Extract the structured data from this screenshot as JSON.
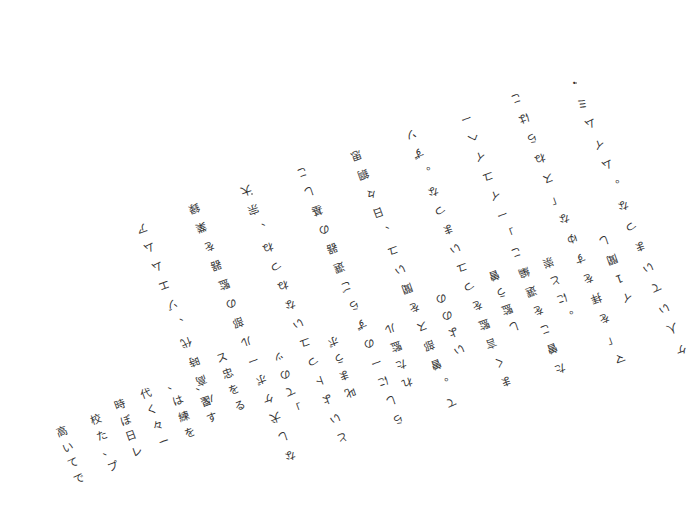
{
  "document": {
    "type": "scanned-vertical-japanese-text",
    "background": "#ffffff",
    "ink": "#333333",
    "rotated_columns": [
      {
        "x": 574,
        "y": 82,
        "dx": 8.2,
        "dy": 20.5,
        "rot": 160,
        "chars": [
          "・",
          "ミ",
          "ム",
          "イ",
          "ム",
          "。",
          "な",
          "つ",
          "ま",
          "い",
          "て",
          "い",
          "人",
          "ケ"
        ]
      },
      {
        "x": 604,
        "y": 240,
        "dx": 7.5,
        "dy": 19,
        "rot": 160,
        "chars": [
          "し",
          "聞",
          "1",
          "イ"
        ]
      },
      {
        "x": 516,
        "y": 98,
        "dx": 8.0,
        "dy": 20,
        "rot": 160,
        "chars": [
          "こ",
          "は",
          "ら",
          "ね",
          "ス",
          "「",
          "な",
          "ゆ",
          "す",
          "を",
          "拝",
          "を",
          "「",
          "マ"
        ]
      },
      {
        "x": 548,
        "y": 262,
        "dx": 7.0,
        "dy": 18,
        "rot": 160,
        "chars": [
          "崇",
          "と",
          "に",
          "。"
        ]
      },
      {
        "x": 466,
        "y": 118,
        "dx": 7.2,
        "dy": 19.2,
        "rot": 160,
        "chars": [
          "ー",
          "ヘ",
          "イ",
          "ユ",
          "イ",
          "ー",
          "」",
          "こ",
          "編",
          "選",
          "を",
          "こ",
          "曽",
          "た"
        ]
      },
      {
        "x": 494,
        "y": 275,
        "dx": 6.5,
        "dy": 17,
        "rot": 160,
        "chars": [
          "曽",
          "う",
          "監",
          "し"
        ]
      },
      {
        "x": 411,
        "y": 134,
        "dx": 7.3,
        "dy": 19,
        "rot": 160,
        "chars": [
          "ソ",
          "ず",
          "。",
          "な",
          "つ",
          "ま",
          "い",
          "ユ",
          "つ",
          "を",
          "監",
          "言",
          "く",
          "ま"
        ]
      },
      {
        "x": 441,
        "y": 298,
        "dx": 6.0,
        "dy": 17,
        "rot": 160,
        "chars": [
          "の",
          "の",
          "よ",
          "い"
        ]
      },
      {
        "x": 356,
        "y": 155,
        "dx": 7.3,
        "dy": 19,
        "rot": 160,
        "chars": [
          "思",
          "鋼",
          "々",
          "日",
          "、",
          "ユ",
          "い",
          "聞",
          "を",
          "ス",
          "部",
          "曽",
          "。",
          "て"
        ]
      },
      {
        "x": 390,
        "y": 328,
        "dx": 5.5,
        "dy": 18,
        "rot": 160,
        "chars": [
          "ル",
          "監",
          "た",
          "れ"
        ]
      },
      {
        "x": 302,
        "y": 172,
        "dx": 7.4,
        "dy": 19,
        "rot": 160,
        "chars": [
          "こ",
          "し",
          "基",
          "の",
          "器",
          "選",
          "ご",
          "ら",
          "ず",
          "の",
          "ー",
          "に",
          "し",
          "ら"
        ]
      },
      {
        "x": 333,
        "y": 341,
        "dx": 5.5,
        "dy": 17,
        "rot": 160,
        "chars": [
          "ボ",
          "う",
          "ま",
          "叱"
        ]
      },
      {
        "x": 246,
        "y": 190,
        "dx": 7.4,
        "dy": 19,
        "rot": 160,
        "chars": [
          "大",
          "宗",
          "、",
          "ね",
          "つ",
          "ね",
          "な",
          "い",
          "ユ",
          "つ",
          "ト",
          "よ",
          "い",
          "と"
        ]
      },
      {
        "x": 279,
        "y": 357,
        "dx": 5.5,
        "dy": 17,
        "rot": 160,
        "chars": [
          "ッ",
          "の",
          "て",
          "」"
        ]
      },
      {
        "x": 194,
        "y": 208,
        "dx": 7.4,
        "dy": 19,
        "rot": 160,
        "chars": [
          "録",
          "業",
          "を",
          "器",
          "監",
          "の",
          "部",
          "ル",
          "ー",
          "ボ",
          "ケ",
          "犬",
          "し",
          "な"
        ]
      },
      {
        "x": 142,
        "y": 228,
        "dx": 7.4,
        "dy": 19,
        "rot": 160,
        "chars": [
          "ア",
          "ム",
          "ム",
          "エ",
          "ゾ",
          "、",
          "代",
          "時",
          "高",
          "バ"
        ]
      }
    ],
    "upright_columns": [
      {
        "x": 62,
        "y": 432,
        "dx": 5.5,
        "dy": 15.5,
        "rot": -20,
        "chars": [
          "高",
          "い",
          "て",
          "で"
        ]
      },
      {
        "x": 96,
        "y": 420,
        "dx": 5.5,
        "dy": 15.5,
        "rot": -20,
        "chars": [
          "校",
          "た",
          "、",
          "プ"
        ]
      },
      {
        "x": 120,
        "y": 405,
        "dx": 5.5,
        "dy": 15.5,
        "rot": -20,
        "chars": [
          "時",
          "ぼ",
          "日",
          "レ"
        ]
      },
      {
        "x": 146,
        "y": 394,
        "dx": 6.0,
        "dy": 16,
        "rot": -20,
        "chars": [
          "代",
          "く",
          "々",
          "ー"
        ]
      },
      {
        "x": 172,
        "y": 385,
        "dx": 6.0,
        "dy": 16,
        "rot": -20,
        "chars": [
          "、",
          "は",
          "練",
          "を"
        ]
      },
      {
        "x": 200,
        "y": 386,
        "dx": 6.0,
        "dy": 16,
        "rot": -20,
        "chars": [
          "、",
          "習",
          "す"
        ]
      },
      {
        "x": 222,
        "y": 358,
        "dx": 6.0,
        "dy": 16,
        "rot": -20,
        "chars": [
          "ス",
          "忠",
          "を",
          "る"
        ]
      }
    ],
    "specks": [
      {
        "x": 251,
        "y": 193
      },
      {
        "x": 575,
        "y": 82
      }
    ]
  }
}
